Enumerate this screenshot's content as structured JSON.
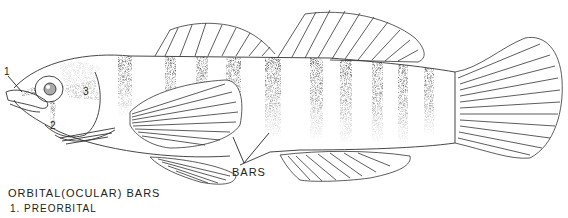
{
  "figure": {
    "labels": {
      "preorbital_num": "1",
      "suborbital_num": "2",
      "postorbital_num": "3",
      "bars": "BARS"
    },
    "caption": {
      "title": "ORBITAL(OCULAR) BARS",
      "items": [
        "1. PREORBITAL"
      ]
    },
    "colors": {
      "line": "#333333",
      "stipple": "#222222",
      "background": "#ffffff"
    },
    "body_bar_count": 10
  }
}
